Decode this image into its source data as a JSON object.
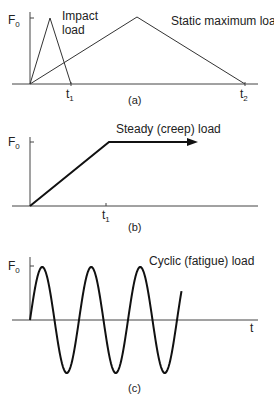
{
  "chart_data": [
    {
      "type": "line",
      "panel": "a",
      "caption": "(a)",
      "ylabel": "F0",
      "series": [
        {
          "name": "Impact load",
          "points": [
            [
              0,
              0
            ],
            [
              0.5,
              1
            ],
            [
              1,
              0
            ]
          ],
          "x_end_label": "t1"
        },
        {
          "name": "Static maximum load",
          "points": [
            [
              0,
              0
            ],
            [
              5,
              1
            ],
            [
              10,
              0
            ]
          ],
          "x_end_label": "t2"
        }
      ],
      "x_ticks": [
        "t1",
        "t2"
      ],
      "annotations": [
        "Impact load",
        "Static maximum load"
      ]
    },
    {
      "type": "line",
      "panel": "b",
      "caption": "(b)",
      "ylabel": "F0",
      "series": [
        {
          "name": "Steady (creep) load",
          "points": [
            [
              0,
              0
            ],
            [
              1,
              1
            ],
            [
              1.8,
              1
            ]
          ],
          "arrow_end": true
        }
      ],
      "x_ticks": [
        "t1"
      ],
      "annotations": [
        "Steady (creep) load"
      ]
    },
    {
      "type": "line",
      "panel": "c",
      "caption": "(c)",
      "ylabel": "F0",
      "xlabel": "t",
      "series": [
        {
          "name": "Cyclic (fatigue) load",
          "function": "F0*sin(t)",
          "cycles": 3.1
        }
      ],
      "annotations": [
        "Cyclic (fatigue) load"
      ]
    }
  ],
  "labels": {
    "f0": "F",
    "f0_sub": "0",
    "t1": "t",
    "t1_sub": "1",
    "t2": "t",
    "t2_sub": "2",
    "t": "t",
    "impact_line1": "Impact",
    "impact_line2": "load",
    "static": "Static maximum load",
    "steady": "Steady (creep) load",
    "cyclic": "Cyclic (fatigue) load",
    "cap_a": "(a)",
    "cap_b": "(b)",
    "cap_c": "(c)"
  }
}
